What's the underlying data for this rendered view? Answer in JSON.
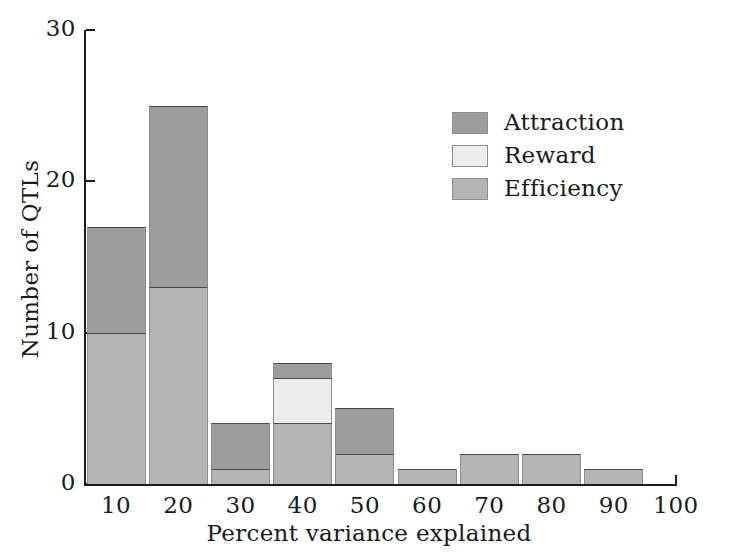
{
  "chart_data": {
    "type": "bar",
    "subtype": "stacked-histogram",
    "title": "",
    "xlabel": "Percent variance explained",
    "ylabel": "Number of QTLs",
    "categories": [
      "10",
      "20",
      "30",
      "40",
      "50",
      "60",
      "70",
      "80",
      "90"
    ],
    "bin_centers": [
      10,
      20,
      30,
      40,
      50,
      60,
      70,
      80,
      90
    ],
    "bin_edges": [
      5,
      15,
      25,
      35,
      45,
      55,
      65,
      75,
      85,
      95
    ],
    "series": [
      {
        "name": "Efficiency",
        "color": "#b4b4b4",
        "values": [
          10,
          13,
          1,
          4,
          2,
          1,
          2,
          2,
          1
        ]
      },
      {
        "name": "Reward",
        "color": "#ececec",
        "values": [
          0,
          0,
          0,
          3,
          0,
          0,
          0,
          0,
          0
        ]
      },
      {
        "name": "Attraction",
        "color": "#9d9d9d",
        "values": [
          7,
          12,
          3,
          1,
          3,
          0,
          0,
          0,
          0
        ]
      }
    ],
    "totals": [
      17,
      25,
      4,
      8,
      5,
      1,
      2,
      2,
      1
    ],
    "stack_order": [
      "Efficiency",
      "Reward",
      "Attraction"
    ],
    "xlim": [
      5,
      100
    ],
    "ylim": [
      0,
      30
    ],
    "xticks": [
      10,
      20,
      30,
      40,
      50,
      60,
      70,
      80,
      90,
      100
    ],
    "xtick_labels": [
      "10",
      "20",
      "30",
      "40",
      "50",
      "60",
      "70",
      "80",
      "90",
      "100"
    ],
    "yticks": [
      0,
      10,
      20,
      30
    ],
    "ytick_labels": [
      "0",
      "10",
      "20",
      "30"
    ],
    "grid": false,
    "legend_position": "upper-right-inside",
    "legend_entries": [
      {
        "label": "Attraction",
        "color": "#9d9d9d"
      },
      {
        "label": "Reward",
        "color": "#ececec"
      },
      {
        "label": "Efficiency",
        "color": "#b4b4b4"
      }
    ]
  },
  "axes": {
    "x_title": "Percent variance explained",
    "y_title": "Number of QTLs"
  },
  "colors": {
    "axis": "#1b1b1b",
    "text": "#1a1a1a",
    "background": "#ffffff",
    "attraction": "#9d9d9d",
    "reward": "#ececec",
    "efficiency": "#b4b4b4",
    "segment_border": "#4a4a4a"
  }
}
